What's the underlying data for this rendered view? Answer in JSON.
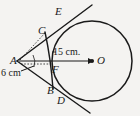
{
  "figure": {
    "background_color": "#f4f3f1",
    "stroke_color": "#1a1a1a",
    "points": [
      {
        "id": "A",
        "label": "A",
        "x": 18,
        "y": 61,
        "role": "external-point"
      },
      {
        "id": "C",
        "label": "C",
        "x": 45,
        "y": 33,
        "role": "circle-intersection-upper-near"
      },
      {
        "id": "E",
        "label": "E",
        "x": 62,
        "y": 17,
        "role": "circle-intersection-upper-far"
      },
      {
        "id": "F",
        "label": "F",
        "x": 54,
        "y": 61,
        "role": "chord-axis-intersection"
      },
      {
        "id": "B",
        "label": "B",
        "x": 54,
        "y": 88,
        "role": "circle-intersection-lower-near"
      },
      {
        "id": "D",
        "label": "D",
        "x": 65,
        "y": 98,
        "role": "circle-intersection-lower-far"
      },
      {
        "id": "O",
        "label": "O",
        "x": 92,
        "y": 61,
        "role": "circle-center"
      }
    ],
    "measurements": [
      {
        "id": "AO",
        "label": "15 cm.",
        "from": "A",
        "to": "O"
      },
      {
        "id": "AC",
        "label": "6 cm",
        "from": "A",
        "to": "C"
      }
    ],
    "circle": {
      "cx": 92,
      "cy": 61,
      "r": 40
    }
  }
}
